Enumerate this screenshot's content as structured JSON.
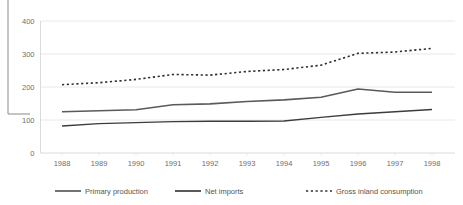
{
  "chart_data": {
    "type": "line",
    "title": "",
    "subtitle": "",
    "xlabel": "",
    "ylabel": "",
    "categories": [
      "1988",
      "1989",
      "1990",
      "1991",
      "1992",
      "1993",
      "1994",
      "1995",
      "1996",
      "1997",
      "1998"
    ],
    "x": [
      1988,
      1989,
      1990,
      1991,
      1992,
      1993,
      1994,
      1995,
      1996,
      1997,
      1998
    ],
    "ylim": [
      0,
      400
    ],
    "yticks": [
      0,
      100,
      200,
      300,
      400
    ],
    "ytick_labels": [
      "0",
      "100",
      "200",
      "300",
      "400"
    ],
    "grid": "horizontal",
    "legend_position": "bottom",
    "series": [
      {
        "name": "Primary production",
        "style": "solid",
        "color": "#5a5a5a",
        "width": 1.6,
        "values": [
          125,
          128,
          131,
          146,
          149,
          156,
          161,
          169,
          194,
          184,
          184
        ]
      },
      {
        "name": "Net imports",
        "style": "solid",
        "color": "#3c3c3c",
        "width": 1.4,
        "values": [
          82,
          89,
          92,
          95,
          96,
          96,
          97,
          108,
          118,
          125,
          132
        ]
      },
      {
        "name": "Gross inland consumption",
        "style": "dotted",
        "color": "#2e2e2e",
        "width": 1.6,
        "values": [
          207,
          213,
          223,
          238,
          236,
          247,
          253,
          266,
          302,
          306,
          317
        ]
      }
    ]
  },
  "legend": {
    "items": [
      {
        "label": "Primary production",
        "style": "solid",
        "color": "#5a5a5a"
      },
      {
        "label": "Net imports",
        "style": "solid",
        "color": "#3c3c3c"
      },
      {
        "label": "Gross inland consumption",
        "style": "dotted",
        "color": "#2e2e2e"
      }
    ]
  }
}
